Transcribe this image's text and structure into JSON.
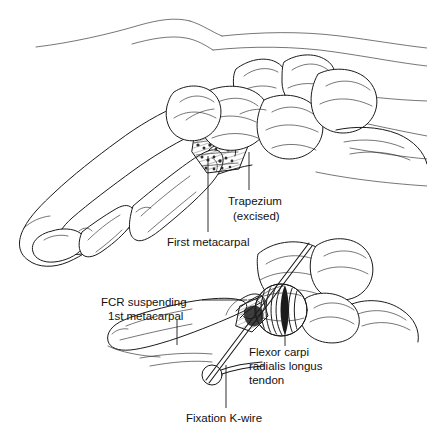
{
  "figure": {
    "background_color": "#ffffff",
    "ink_color": "#1a1a1a",
    "view": "Lateral view of thumb and wrist with magnified inset"
  },
  "labels": {
    "trapezium": {
      "line1": "Trapezium",
      "line2": "(excised)",
      "anchor_x": 228,
      "anchor_y": 201
    },
    "first_metacarpal": {
      "text": "First metacarpal",
      "anchor_x": 167,
      "anchor_y": 243
    },
    "fcr_suspending": {
      "line1": "FCR suspending",
      "line2": "1st metacarpal",
      "anchor_x": 103,
      "anchor_y": 303
    },
    "flexor_carpi": {
      "line1": "Flexor carpi",
      "line2": "radialis longus",
      "line3": "tendon",
      "anchor_x": 249,
      "anchor_y": 350
    },
    "fixation_kwire": {
      "text": "Fixation K-wire",
      "anchor_x": 186,
      "anchor_y": 418
    }
  },
  "structures": [
    {
      "name": "thumb-skin-outline",
      "description": "Skin contour of thumb and dorsum of hand"
    },
    {
      "name": "distal-phalanx",
      "description": "Distal phalanx of thumb"
    },
    {
      "name": "proximal-phalanx",
      "description": "Proximal phalanx of thumb"
    },
    {
      "name": "first-metacarpal-bone",
      "description": "First metacarpal shaft"
    },
    {
      "name": "trapezium-excision-space",
      "description": "Hatched void where trapezium was removed"
    },
    {
      "name": "carpal-bones",
      "description": "Remaining carpal bones of the wrist"
    },
    {
      "name": "radius-ulna",
      "description": "Distal radius and ulna"
    },
    {
      "name": "fcr-tendon-coil",
      "description": "Coiled flexor carpi radialis tendon interposition"
    },
    {
      "name": "kwire",
      "description": "Fixation Kirschner wire crossing the arthroplasty space"
    }
  ]
}
